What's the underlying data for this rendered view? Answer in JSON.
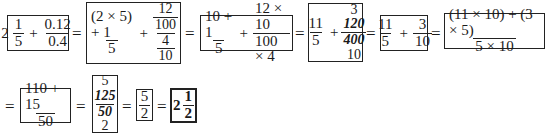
{
  "equals_sign": "=",
  "plus_sign": "+",
  "steps": [
    {
      "whole": "2",
      "frac1": {
        "num": "1",
        "den": "5"
      },
      "frac2": {
        "num": "0.12",
        "den": "0.4"
      }
    },
    {
      "frac1": {
        "num": "(2 × 5) + 1",
        "den": "5"
      },
      "complex": {
        "top_num": "12",
        "top_den": "100",
        "bot_num": "4",
        "bot_den": "10"
      }
    },
    {
      "frac1": {
        "num": "10 + 1",
        "den": "5"
      },
      "frac2": {
        "num": "12 × 10",
        "den": "100 × 4"
      }
    },
    {
      "frac1": {
        "num": "11",
        "den": "5"
      },
      "cancel": {
        "above": "3",
        "num": "120",
        "den": "400",
        "below": "10"
      }
    },
    {
      "frac1": {
        "num": "11",
        "den": "5"
      },
      "frac2": {
        "num": "3",
        "den": "10"
      }
    },
    {
      "frac1": {
        "num": "(11 × 10) + (3 × 5)",
        "den": "5 × 10"
      }
    },
    {
      "frac1": {
        "num": "110 + 15",
        "den": "50"
      }
    },
    {
      "cancel": {
        "above": "5",
        "num": "125",
        "den": "50",
        "below": "2"
      }
    },
    {
      "frac1": {
        "num": "5",
        "den": "2"
      }
    },
    {
      "whole": "2",
      "frac1": {
        "num": "1",
        "den": "2"
      }
    }
  ]
}
